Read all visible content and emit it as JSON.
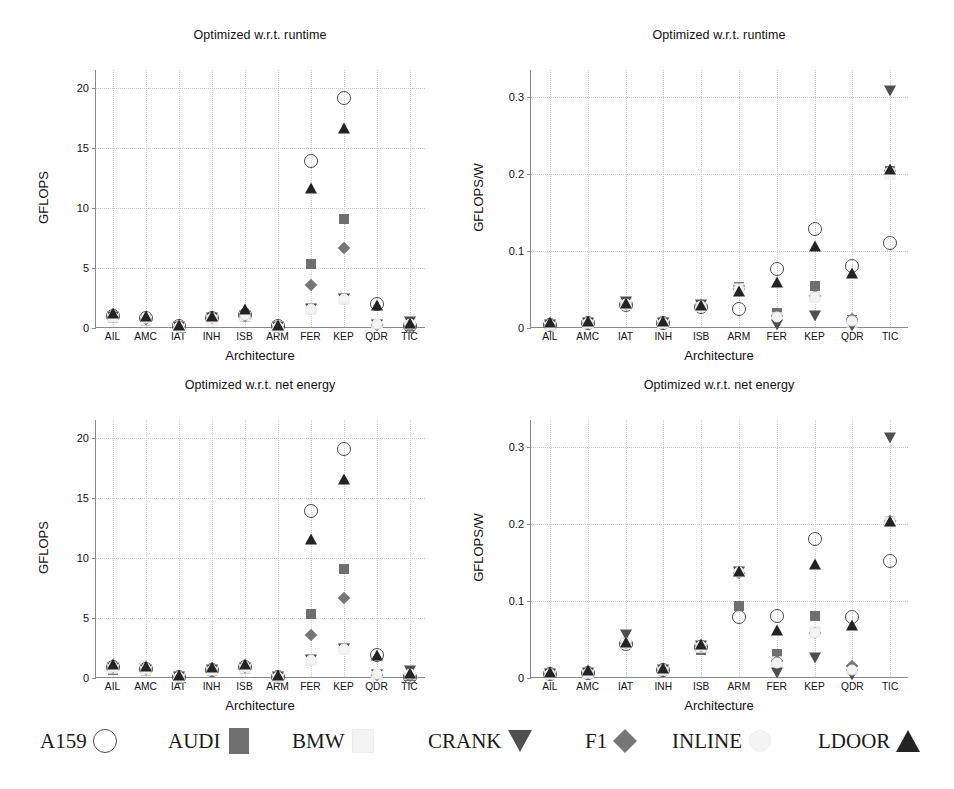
{
  "figure": {
    "background_color": "#ffffff"
  },
  "panels": [
    {
      "id": "top-left",
      "title": "Optimized w.r.t. runtime",
      "ylabel": "GFLOPS",
      "xlabel": "Architecture"
    },
    {
      "id": "top-right",
      "title": "Optimized w.r.t. runtime",
      "ylabel": "GFLOPS/W",
      "xlabel": "Architecture"
    },
    {
      "id": "bottom-left",
      "title": "Optimized w.r.t. net energy",
      "ylabel": "GFLOPS",
      "xlabel": "Architecture"
    },
    {
      "id": "bottom-right",
      "title": "Optimized w.r.t. net energy",
      "ylabel": "GFLOPS/W",
      "xlabel": "Architecture"
    }
  ],
  "legend": {
    "position": "bottom",
    "entries": [
      {
        "label": "A159",
        "marker": "circle",
        "color": "#4a4a4a"
      },
      {
        "label": "AUDI",
        "marker": "square",
        "color": "#6f6f6f"
      },
      {
        "label": "BMW",
        "marker": "bmw",
        "color": "#f3f3f3"
      },
      {
        "label": "CRANK",
        "marker": "tri-down",
        "color": "#4f4f4f"
      },
      {
        "label": "F1",
        "marker": "diamond",
        "color": "#777777"
      },
      {
        "label": "INLINE",
        "marker": "inline",
        "color": "#f4f4f4"
      },
      {
        "label": "LDOOR",
        "marker": "tri-up",
        "color": "#232323"
      }
    ]
  },
  "chart_data": [
    {
      "id": "top-left",
      "type": "scatter",
      "title": "Optimized w.r.t. runtime",
      "xlabel": "Architecture",
      "ylabel": "GFLOPS",
      "categories": [
        "AIL",
        "AMC",
        "IAT",
        "INH",
        "ISB",
        "ARM",
        "FER",
        "KEP",
        "QDR",
        "TIC"
      ],
      "yticks": [
        0,
        5,
        10,
        15,
        20
      ],
      "ylim": [
        0,
        21.5
      ],
      "grid": true,
      "series": [
        {
          "name": "A159",
          "marker": "circle",
          "values": [
            1.0,
            0.8,
            0.15,
            0.8,
            1.1,
            0.15,
            13.9,
            19.2,
            2.0,
            0.15
          ]
        },
        {
          "name": "AUDI",
          "marker": "square",
          "values": [
            0.8,
            0.6,
            0.1,
            0.7,
            0.9,
            0.1,
            5.3,
            9.1,
            0.3,
            0.2
          ]
        },
        {
          "name": "BMW",
          "marker": "bmw",
          "values": [
            0.9,
            0.7,
            0.1,
            0.7,
            1.0,
            0.1,
            1.6,
            2.4,
            0.3,
            0.3
          ]
        },
        {
          "name": "CRANK",
          "marker": "tri-down",
          "values": [
            0.9,
            0.7,
            0.1,
            0.8,
            1.0,
            0.1,
            1.6,
            2.4,
            0.25,
            0.5
          ]
        },
        {
          "name": "F1",
          "marker": "diamond",
          "values": [
            0.9,
            0.75,
            0.12,
            0.8,
            1.0,
            0.12,
            3.6,
            6.7,
            0.25,
            0.2
          ]
        },
        {
          "name": "INLINE",
          "marker": "inline",
          "values": [
            0.95,
            0.8,
            0.12,
            0.8,
            1.1,
            0.12,
            1.6,
            2.4,
            0.3,
            0.3
          ]
        },
        {
          "name": "LDOOR",
          "marker": "tri-up",
          "values": [
            1.2,
            0.95,
            0.2,
            0.9,
            1.5,
            0.2,
            11.6,
            16.6,
            1.8,
            0.3
          ]
        }
      ]
    },
    {
      "id": "top-right",
      "type": "scatter",
      "title": "Optimized w.r.t. runtime",
      "xlabel": "Architecture",
      "ylabel": "GFLOPS/W",
      "categories": [
        "AIL",
        "AMC",
        "IAT",
        "INH",
        "ISB",
        "ARM",
        "FER",
        "KEP",
        "QDR",
        "TIC"
      ],
      "yticks": [
        0,
        0.1,
        0.2,
        0.3
      ],
      "ylim": [
        0,
        0.335
      ],
      "grid": true,
      "series": [
        {
          "name": "A159",
          "marker": "circle",
          "values": [
            0.004,
            0.006,
            0.03,
            0.006,
            0.027,
            0.025,
            0.077,
            0.128,
            0.08,
            0.111
          ]
        },
        {
          "name": "AUDI",
          "marker": "square",
          "values": [
            0.004,
            0.006,
            0.032,
            0.007,
            0.029,
            0.053,
            0.02,
            0.055,
            0.011,
            0.204
          ]
        },
        {
          "name": "BMW",
          "marker": "bmw",
          "values": [
            0.004,
            0.006,
            0.031,
            0.007,
            0.028,
            0.05,
            0.013,
            0.04,
            0.008,
            0.2
          ]
        },
        {
          "name": "CRANK",
          "marker": "tri-down",
          "values": [
            0.004,
            0.006,
            0.034,
            0.007,
            0.03,
            0.048,
            0.004,
            0.016,
            0.003,
            0.308
          ]
        },
        {
          "name": "F1",
          "marker": "diamond",
          "values": [
            0.004,
            0.006,
            0.031,
            0.007,
            0.03,
            0.05,
            0.016,
            0.042,
            0.012,
            0.204
          ]
        },
        {
          "name": "INLINE",
          "marker": "inline",
          "values": [
            0.004,
            0.006,
            0.031,
            0.007,
            0.029,
            0.05,
            0.014,
            0.04,
            0.009,
            0.202
          ]
        },
        {
          "name": "LDOOR",
          "marker": "tri-up",
          "values": [
            0.006,
            0.008,
            0.031,
            0.008,
            0.029,
            0.047,
            0.059,
            0.105,
            0.07,
            0.205
          ]
        }
      ]
    },
    {
      "id": "bottom-left",
      "type": "scatter",
      "title": "Optimized w.r.t. net energy",
      "xlabel": "Architecture",
      "ylabel": "GFLOPS",
      "categories": [
        "AIL",
        "AMC",
        "IAT",
        "INH",
        "ISB",
        "ARM",
        "FER",
        "KEP",
        "QDR",
        "TIC"
      ],
      "yticks": [
        0,
        5,
        10,
        15,
        20
      ],
      "ylim": [
        0,
        21.5
      ],
      "grid": true,
      "series": [
        {
          "name": "A159",
          "marker": "circle",
          "values": [
            0.9,
            0.75,
            0.12,
            0.7,
            0.9,
            0.12,
            13.9,
            19.1,
            1.9,
            0.1
          ]
        },
        {
          "name": "AUDI",
          "marker": "square",
          "values": [
            0.7,
            0.6,
            0.1,
            0.6,
            0.75,
            0.1,
            5.3,
            9.1,
            0.25,
            0.2
          ]
        },
        {
          "name": "BMW",
          "marker": "bmw",
          "values": [
            0.85,
            0.7,
            0.1,
            0.65,
            0.85,
            0.1,
            1.5,
            2.4,
            0.25,
            0.3
          ]
        },
        {
          "name": "CRANK",
          "marker": "tri-down",
          "values": [
            0.85,
            0.7,
            0.1,
            0.7,
            0.85,
            0.1,
            1.5,
            2.4,
            0.25,
            0.6
          ]
        },
        {
          "name": "F1",
          "marker": "diamond",
          "values": [
            0.9,
            0.75,
            0.12,
            0.7,
            0.9,
            0.12,
            3.6,
            6.7,
            0.25,
            0.2
          ]
        },
        {
          "name": "INLINE",
          "marker": "inline",
          "values": [
            0.9,
            0.75,
            0.12,
            0.7,
            0.9,
            0.12,
            1.5,
            2.4,
            0.3,
            0.3
          ]
        },
        {
          "name": "LDOOR",
          "marker": "tri-up",
          "values": [
            1.1,
            0.95,
            0.15,
            0.85,
            1.1,
            0.15,
            11.5,
            16.5,
            1.8,
            0.3
          ]
        }
      ]
    },
    {
      "id": "bottom-right",
      "type": "scatter",
      "title": "Optimized w.r.t. net energy",
      "xlabel": "Architecture",
      "ylabel": "GFLOPS/W",
      "categories": [
        "AIL",
        "AMC",
        "IAT",
        "INH",
        "ISB",
        "ARM",
        "FER",
        "KEP",
        "QDR",
        "TIC"
      ],
      "yticks": [
        0,
        0.1,
        0.2,
        0.3
      ],
      "ylim": [
        0,
        0.335
      ],
      "grid": true,
      "series": [
        {
          "name": "A159",
          "marker": "circle",
          "values": [
            0.005,
            0.007,
            0.044,
            0.01,
            0.04,
            0.079,
            0.081,
            0.181,
            0.079,
            0.152
          ]
        },
        {
          "name": "AUDI",
          "marker": "square",
          "values": [
            0.005,
            0.007,
            0.046,
            0.011,
            0.037,
            0.094,
            0.031,
            0.081,
            0.012,
            0.204
          ]
        },
        {
          "name": "BMW",
          "marker": "bmw",
          "values": [
            0.005,
            0.007,
            0.046,
            0.011,
            0.04,
            0.137,
            0.021,
            0.06,
            0.01,
            0.203
          ]
        },
        {
          "name": "CRANK",
          "marker": "tri-down",
          "values": [
            0.005,
            0.007,
            0.056,
            0.011,
            0.042,
            0.137,
            0.006,
            0.026,
            0.004,
            0.312
          ]
        },
        {
          "name": "F1",
          "marker": "diamond",
          "values": [
            0.005,
            0.007,
            0.046,
            0.011,
            0.041,
            0.136,
            0.022,
            0.059,
            0.015,
            0.204
          ]
        },
        {
          "name": "INLINE",
          "marker": "inline",
          "values": [
            0.005,
            0.007,
            0.046,
            0.011,
            0.041,
            0.137,
            0.02,
            0.059,
            0.011,
            0.203
          ]
        },
        {
          "name": "LDOOR",
          "marker": "tri-up",
          "values": [
            0.007,
            0.009,
            0.046,
            0.012,
            0.043,
            0.138,
            0.061,
            0.147,
            0.068,
            0.203
          ]
        }
      ]
    }
  ]
}
